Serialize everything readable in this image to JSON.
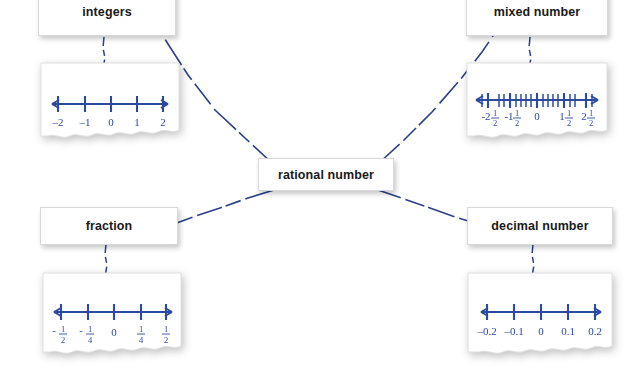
{
  "diagram": {
    "type": "concept-map",
    "background_color": "#ffffff",
    "line_color": "#2b3f8c",
    "axis_color": "#2b4ba0",
    "label_text_color": "#1a1a1a"
  },
  "center": {
    "label": "rational number",
    "name": "rational-number"
  },
  "nodes": [
    {
      "id": "integers",
      "label": "integers",
      "position": "top-left",
      "number_line": {
        "labels": [
          "–2",
          "–1",
          "0",
          "1",
          "2"
        ],
        "values": [
          -2,
          -1,
          0,
          1,
          2
        ],
        "tick_count": 5,
        "minor_ticks": 0,
        "arrows": "both"
      }
    },
    {
      "id": "mixed-number",
      "label": "mixed number",
      "position": "top-right",
      "number_line": {
        "labels": [
          "-2½",
          "-1½",
          "0",
          "1½",
          "2½"
        ],
        "values": [
          -2.5,
          -1.5,
          0,
          1.5,
          2.5
        ],
        "tick_count": 5,
        "minor_ticks": 12,
        "arrows": "both"
      }
    },
    {
      "id": "fraction",
      "label": "fraction",
      "position": "bottom-left",
      "number_line": {
        "labels": [
          "-½",
          "-¼",
          "0",
          "¼",
          "½"
        ],
        "values": [
          -0.5,
          -0.25,
          0,
          0.25,
          0.5
        ],
        "tick_count": 5,
        "minor_ticks": 0,
        "arrows": "both"
      }
    },
    {
      "id": "decimal-number",
      "label": "decimal number",
      "position": "bottom-right",
      "number_line": {
        "labels": [
          "–0.2",
          "–0.1",
          "0",
          "0.1",
          "0.2"
        ],
        "values": [
          -0.2,
          -0.1,
          0,
          0.1,
          0.2
        ],
        "tick_count": 5,
        "minor_ticks": 0,
        "arrows": "both"
      }
    }
  ],
  "connectors": [
    {
      "from": "rational-number",
      "to": "integers",
      "style": "dashed"
    },
    {
      "from": "rational-number",
      "to": "mixed-number",
      "style": "dashed"
    },
    {
      "from": "rational-number",
      "to": "fraction",
      "style": "dashed"
    },
    {
      "from": "rational-number",
      "to": "decimal-number",
      "style": "dashed"
    },
    {
      "from": "integers",
      "to": "integers-number-line",
      "style": "dashed-vertical"
    },
    {
      "from": "mixed-number",
      "to": "mixed-number-number-line",
      "style": "dashed-vertical"
    },
    {
      "from": "fraction",
      "to": "fraction-number-line",
      "style": "dashed-vertical"
    },
    {
      "from": "decimal-number",
      "to": "decimal-number-number-line",
      "style": "dashed-vertical"
    }
  ]
}
